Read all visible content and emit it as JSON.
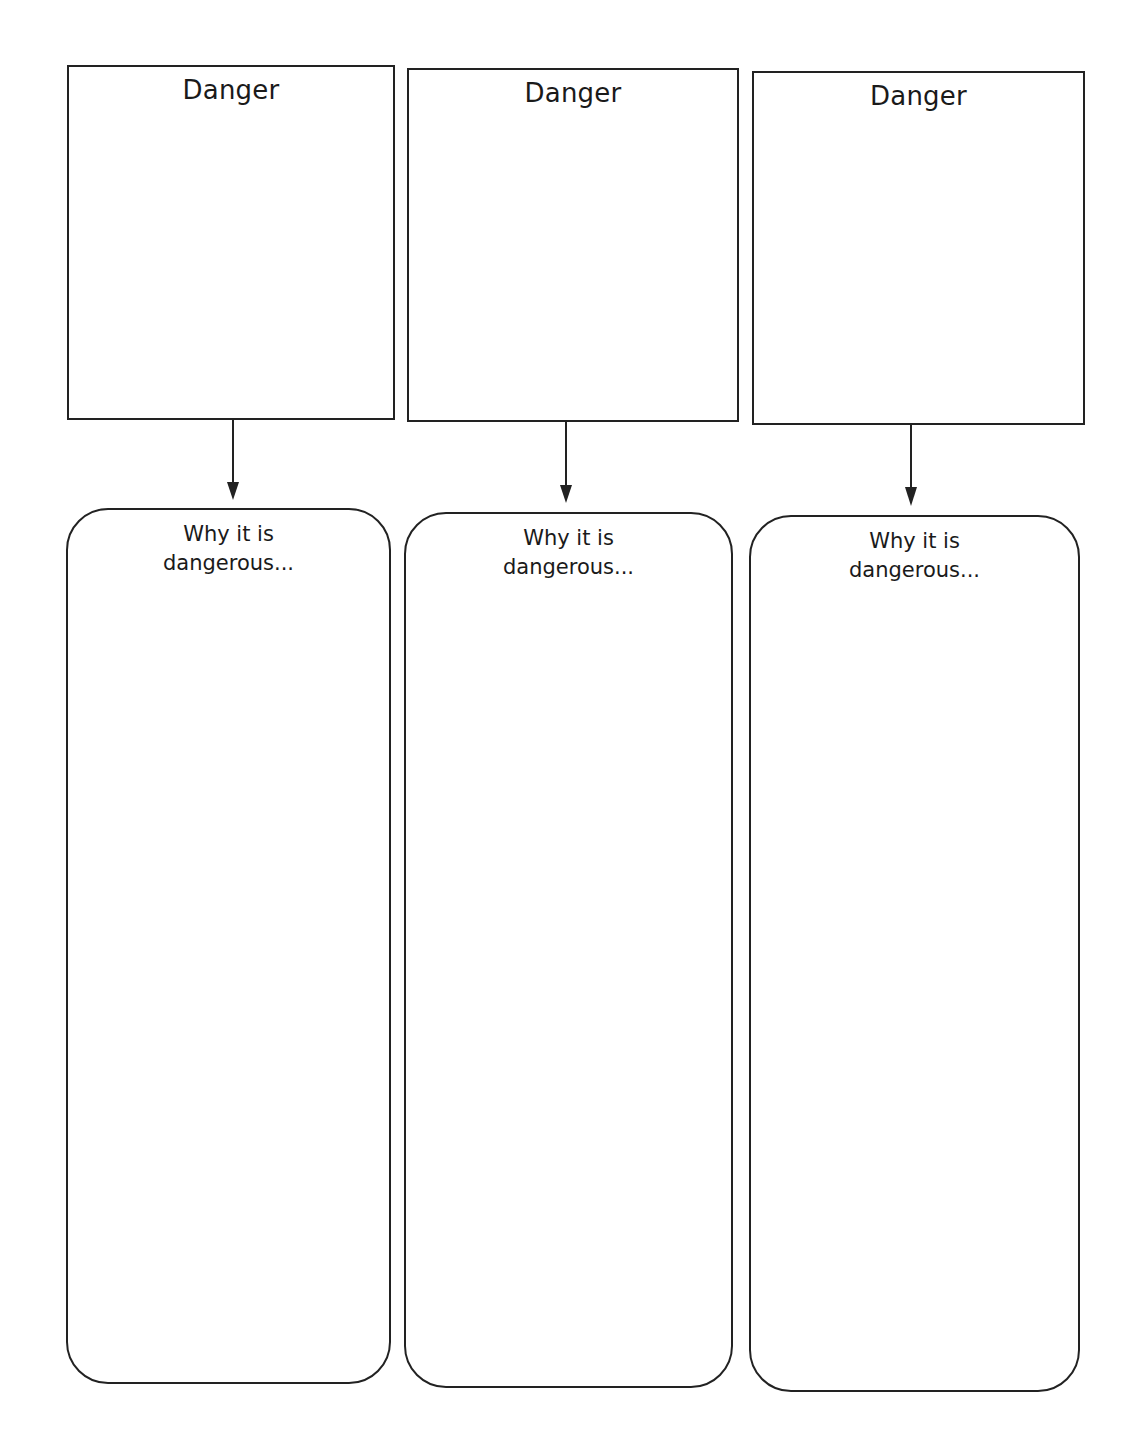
{
  "worksheet": {
    "columns": [
      {
        "danger_label": "Danger",
        "reason_line1": "Why it is",
        "reason_line2": "dangerous..."
      },
      {
        "danger_label": "Danger",
        "reason_line1": "Why it is",
        "reason_line2": "dangerous..."
      },
      {
        "danger_label": "Danger",
        "reason_line1": "Why it is",
        "reason_line2": "dangerous..."
      }
    ],
    "colors": {
      "stroke": "#222222",
      "background": "#ffffff",
      "text": "#1a1a1a"
    }
  }
}
